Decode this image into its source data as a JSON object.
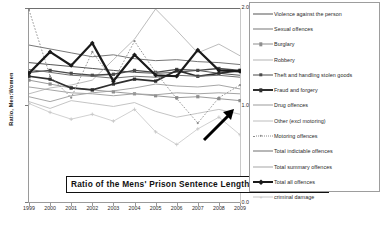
{
  "chart_data": {
    "type": "line",
    "title": "Ratio of the Mens' Prison Sentence Length to that of Women",
    "xlabel": "",
    "ylabel": "Ratio, Men:Women",
    "ylim": [
      0.0,
      2.0
    ],
    "yticks": [
      "2.0",
      "1.0",
      "0.0"
    ],
    "grid": false,
    "legend_position": "right",
    "x": [
      1999,
      2000,
      2001,
      2002,
      2003,
      2004,
      2005,
      2006,
      2007,
      2008,
      2009
    ],
    "categories": [
      "1999",
      "2000",
      "2001",
      "2002",
      "2003",
      "2004",
      "2005",
      "2006",
      "2007",
      "2008",
      "2009"
    ],
    "annotations": [
      {
        "type": "arrow",
        "label": "",
        "points_to": "Total all offences 2009"
      }
    ],
    "series": [
      {
        "name": "Violence against the person",
        "color": "#555555",
        "width": 1.0,
        "marker": "none",
        "dash": "none",
        "values": [
          1.44,
          1.42,
          1.4,
          1.38,
          1.36,
          1.34,
          1.33,
          1.34,
          1.36,
          1.33,
          1.31
        ]
      },
      {
        "name": "Sexual offences",
        "color": "#777777",
        "width": 1.0,
        "marker": "none",
        "dash": "none",
        "values": [
          1.62,
          1.58,
          1.54,
          1.5,
          1.52,
          1.48,
          1.46,
          1.47,
          1.45,
          1.44,
          1.42
        ]
      },
      {
        "name": "Burglary",
        "color": "#8e8e8e",
        "width": 0.9,
        "marker": "square",
        "dash": "none",
        "values": [
          1.26,
          1.22,
          1.18,
          1.16,
          1.14,
          1.12,
          1.1,
          1.08,
          1.09,
          1.07,
          1.05
        ]
      },
      {
        "name": "Robbery",
        "color": "#b4b4b4",
        "width": 0.9,
        "marker": "none",
        "dash": "none",
        "values": [
          1.12,
          1.18,
          1.21,
          1.26,
          1.47,
          1.68,
          1.99,
          1.77,
          1.54,
          1.63,
          1.51
        ]
      },
      {
        "name": "Theft and handling stolen goods",
        "color": "#4a4a4a",
        "width": 1.4,
        "marker": "square",
        "dash": "none",
        "values": [
          1.34,
          1.36,
          1.33,
          1.31,
          1.32,
          1.36,
          1.34,
          1.37,
          1.36,
          1.38,
          1.36
        ]
      },
      {
        "name": "Fraud and forgery",
        "color": "#2e2e2e",
        "width": 1.7,
        "marker": "square",
        "dash": "none",
        "values": [
          1.3,
          1.27,
          1.18,
          1.16,
          1.22,
          1.27,
          1.25,
          1.36,
          1.3,
          1.33,
          1.36
        ]
      },
      {
        "name": "Drug offences",
        "color": "#9c9c9c",
        "width": 0.9,
        "marker": "none",
        "dash": "none",
        "values": [
          1.09,
          1.04,
          1.1,
          1.13,
          1.15,
          1.18,
          1.22,
          1.2,
          1.19,
          1.21,
          1.17
        ]
      },
      {
        "name": "Other (excl motoring)",
        "color": "#bdbdbd",
        "width": 0.9,
        "marker": "none",
        "dash": "none",
        "values": [
          1.04,
          0.97,
          1.05,
          1.02,
          0.99,
          1.03,
          0.94,
          0.88,
          0.92,
          0.96,
          0.91
        ]
      },
      {
        "name": "Motoring offences",
        "color": "#8a8a8a",
        "width": 0.9,
        "marker": "dot",
        "dash": "dotted",
        "values": [
          1.98,
          1.3,
          1.08,
          1.55,
          1.25,
          1.66,
          1.34,
          1.07,
          0.82,
          1.08,
          1.21
        ]
      },
      {
        "name": "Total indictable offences",
        "color": "#707070",
        "width": 1.0,
        "marker": "none",
        "dash": "none",
        "values": [
          1.37,
          1.34,
          1.31,
          1.3,
          1.28,
          1.3,
          1.29,
          1.31,
          1.3,
          1.31,
          1.29
        ]
      },
      {
        "name": "Total summary offences",
        "color": "#a5a5a5",
        "width": 1.0,
        "marker": "none",
        "dash": "none",
        "values": [
          1.19,
          1.16,
          1.13,
          1.12,
          1.1,
          1.12,
          1.11,
          1.13,
          1.12,
          1.13,
          1.12
        ]
      },
      {
        "name": "Total all offences",
        "color": "#1a1a1a",
        "width": 2.2,
        "marker": "diamond",
        "dash": "none",
        "values": [
          1.33,
          1.55,
          1.41,
          1.64,
          1.25,
          1.52,
          1.31,
          1.3,
          1.57,
          1.36,
          1.35
        ]
      },
      {
        "name": "criminal damage",
        "color": "#c5c5c5",
        "width": 0.8,
        "marker": "plus",
        "dash": "none",
        "values": [
          1.02,
          0.93,
          0.86,
          0.91,
          0.84,
          0.96,
          0.73,
          0.6,
          0.76,
          0.88,
          0.7
        ]
      }
    ]
  }
}
